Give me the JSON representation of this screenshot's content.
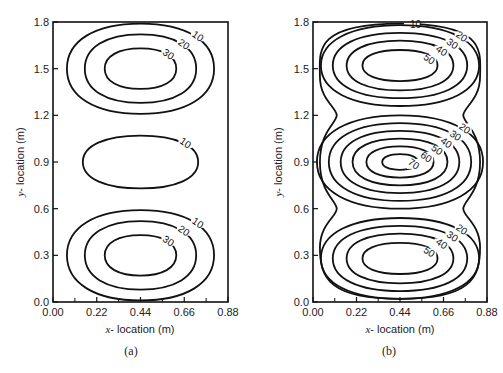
{
  "chart_data": [
    {
      "type": "contour",
      "panel": "(a)",
      "xlabel": "x-location (m)",
      "ylabel": "y-location (m)",
      "xlim": [
        0.0,
        0.88
      ],
      "ylim": [
        0.0,
        1.8
      ],
      "xticks": [
        "0.00",
        "0.22",
        "0.44",
        "0.66",
        "0.88"
      ],
      "yticks": [
        "0.0",
        "0.3",
        "0.6",
        "0.9",
        "1.2",
        "1.5",
        "1.8"
      ],
      "contour_levels": [
        10,
        20,
        30
      ],
      "cells": [
        {
          "center": [
            0.44,
            1.5
          ],
          "levels": [
            10,
            20,
            30
          ],
          "rx": [
            0.37,
            0.28,
            0.18
          ],
          "ry": [
            0.29,
            0.22,
            0.13
          ]
        },
        {
          "center": [
            0.44,
            0.9
          ],
          "levels": [
            10
          ],
          "rx": [
            0.29
          ],
          "ry": [
            0.17
          ]
        },
        {
          "center": [
            0.44,
            0.3
          ],
          "levels": [
            10,
            20,
            30
          ],
          "rx": [
            0.37,
            0.28,
            0.18
          ],
          "ry": [
            0.29,
            0.22,
            0.13
          ]
        }
      ]
    },
    {
      "type": "contour",
      "panel": "(b)",
      "xlabel": "x-location (m)",
      "ylabel": "y-location (m)",
      "xlim": [
        0.0,
        0.88
      ],
      "ylim": [
        0.0,
        1.8
      ],
      "xticks": [
        "0.00",
        "0.22",
        "0.44",
        "0.66",
        "0.88"
      ],
      "yticks": [
        "0.0",
        "0.3",
        "0.6",
        "0.9",
        "1.2",
        "1.5",
        "1.8"
      ],
      "contour_levels": [
        10,
        20,
        30,
        40,
        50,
        60,
        70
      ],
      "cells": [
        {
          "center": [
            0.44,
            1.52
          ],
          "levels": [
            20,
            30,
            40,
            50
          ],
          "rx": [
            0.4,
            0.34,
            0.27,
            0.19
          ],
          "ry": [
            0.26,
            0.21,
            0.16,
            0.1
          ]
        },
        {
          "center": [
            0.44,
            0.9
          ],
          "levels": [
            20,
            30,
            40,
            50,
            60,
            70
          ],
          "rx": [
            0.42,
            0.36,
            0.3,
            0.24,
            0.17,
            0.09
          ],
          "ry": [
            0.3,
            0.25,
            0.2,
            0.15,
            0.1,
            0.05
          ]
        },
        {
          "center": [
            0.44,
            0.28
          ],
          "levels": [
            20,
            30,
            40,
            50
          ],
          "rx": [
            0.4,
            0.34,
            0.27,
            0.19
          ],
          "ry": [
            0.26,
            0.21,
            0.16,
            0.1
          ]
        }
      ],
      "outer_level": 10
    }
  ],
  "captions": {
    "a": "(a)",
    "b": "(b)"
  },
  "labels": {
    "a": {
      "ylabel_italic": "y",
      "ylabel_rest": "- location  (m)",
      "xlabel_italic": "x",
      "xlabel_rest": "- location  (m)"
    },
    "b": {
      "ylabel_italic": "y",
      "ylabel_rest": "- location  (m)",
      "xlabel_italic": "x",
      "xlabel_rest": "- location  (m)"
    }
  }
}
